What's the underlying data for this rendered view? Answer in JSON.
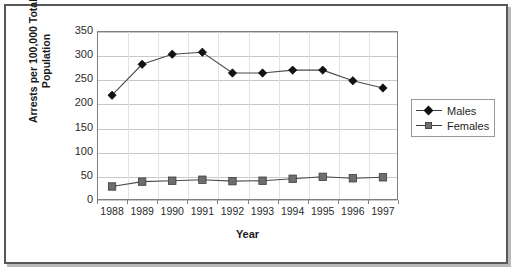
{
  "chart_data": {
    "type": "line",
    "title": "",
    "xlabel": "Year",
    "ylabel": "Arrests per 100,000 Total Population",
    "categories": [
      "1988",
      "1989",
      "1990",
      "1991",
      "1992",
      "1993",
      "1994",
      "1995",
      "1996",
      "1997"
    ],
    "series": [
      {
        "name": "Males",
        "marker": "diamond",
        "color": "#121212",
        "values": [
          217,
          281,
          302,
          306,
          263,
          263,
          269,
          269,
          247,
          232
        ]
      },
      {
        "name": "Females",
        "marker": "square",
        "color": "#6e6e6e",
        "values": [
          28,
          38,
          40,
          42,
          39,
          40,
          44,
          48,
          45,
          47
        ]
      }
    ],
    "ylim": [
      0,
      350
    ],
    "yticks": [
      0,
      50,
      100,
      150,
      200,
      250,
      300,
      350
    ],
    "ytick_labels": [
      "0",
      "50",
      "100",
      "150",
      "200",
      "250",
      "300",
      "350"
    ],
    "grid": "horizontal",
    "legend_position": "right"
  },
  "axes": {
    "y_title": "Arrests per 100,000 Total Population",
    "x_title": "Year"
  },
  "legend": {
    "entries": [
      {
        "label": "Males"
      },
      {
        "label": "Females"
      }
    ]
  }
}
